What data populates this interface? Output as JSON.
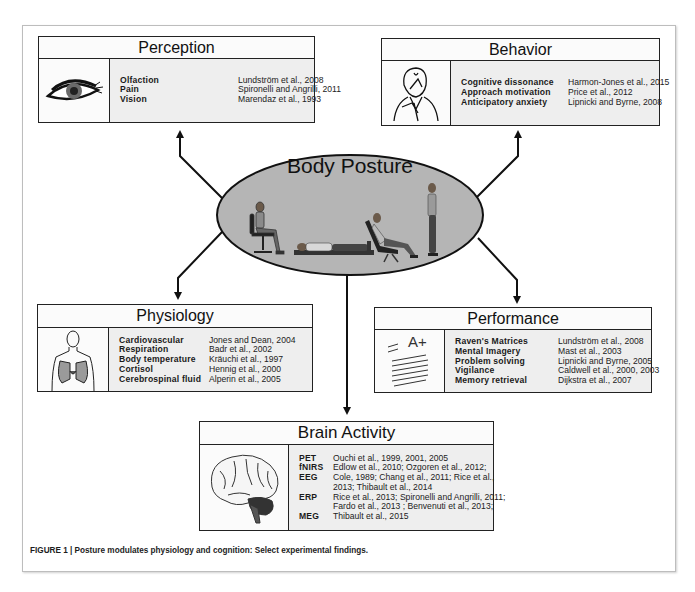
{
  "center": {
    "title": "Body Posture",
    "figures": [
      "seated-chair",
      "supine-lying",
      "reclined-chair",
      "standing"
    ]
  },
  "perception": {
    "title": "Perception",
    "icon": "eye-icon",
    "rows": [
      {
        "topic": "Olfaction",
        "ref": "Lundström et al., 2008"
      },
      {
        "topic": "Pain",
        "ref": "Spironelli and Angrilli, 2011"
      },
      {
        "topic": "Vision",
        "ref": "Marendaz et al., 1993"
      }
    ]
  },
  "behavior": {
    "title": "Behavior",
    "icon": "thinking-man-icon",
    "rows": [
      {
        "topic": "Cognitive dissonance",
        "ref": "Harmon-Jones et al., 2015"
      },
      {
        "topic": "Approach motivation",
        "ref": "Price et al., 2012"
      },
      {
        "topic": "Anticipatory anxiety",
        "ref": "Lipnicki and Byrne, 2008"
      }
    ]
  },
  "physiology": {
    "title": "Physiology",
    "icon": "torso-lungs-icon",
    "rows": [
      {
        "topic": "Cardiovascular",
        "ref": "Jones and Dean, 2004"
      },
      {
        "topic": "Respiration",
        "ref": "Badr et al., 2002"
      },
      {
        "topic": "Body temperature",
        "ref": "Kräuchi et al., 1997"
      },
      {
        "topic": "Cortisol",
        "ref": "Hennig et al., 2000"
      },
      {
        "topic": "Cerebrospinal fluid",
        "ref": "Alperin et al., 2005"
      }
    ]
  },
  "performance": {
    "title": "Performance",
    "icon": "graded-paper-icon",
    "grade": "A+",
    "rows": [
      {
        "topic": "Raven's Matrices",
        "ref": "Lundström et al., 2008"
      },
      {
        "topic": "Mental Imagery",
        "ref": "Mast et al., 2003"
      },
      {
        "topic": "Problem solving",
        "ref": "Lipnicki and Byrne, 2005"
      },
      {
        "topic": "Vigilance",
        "ref": "Caldwell et al., 2000, 2003"
      },
      {
        "topic": "Memory retrieval",
        "ref": "Dijkstra et al., 2007"
      }
    ]
  },
  "brain": {
    "title": "Brain Activity",
    "icon": "brain-icon",
    "rows": [
      {
        "topic": "PET",
        "ref": "Ouchi et al., 1999, 2001, 2005"
      },
      {
        "topic": "fNIRS",
        "ref": "Edlow et al., 2010; Ozgoren et al., 2012;"
      },
      {
        "topic": "EEG",
        "ref": "Cole, 1989; Chang et al., 2011; Rice et al.,"
      },
      {
        "topic": "",
        "ref": "2013; Thibault et al., 2014"
      },
      {
        "topic": "ERP",
        "ref": "Rice et al., 2013; Spironelli and Angrilli, 2011;"
      },
      {
        "topic": "",
        "ref": "Fardo et al., 2013 ; Benvenuti et al., 2013;"
      },
      {
        "topic": "MEG",
        "ref": "Thibault et al., 2015"
      }
    ]
  },
  "caption": "FIGURE 1 | Posture modulates physiology and cognition: Select experimental findings.",
  "colors": {
    "ellipse_fill": "#b5b5b5",
    "box_fill": "#efefef",
    "stroke": "#1a1a1a"
  }
}
